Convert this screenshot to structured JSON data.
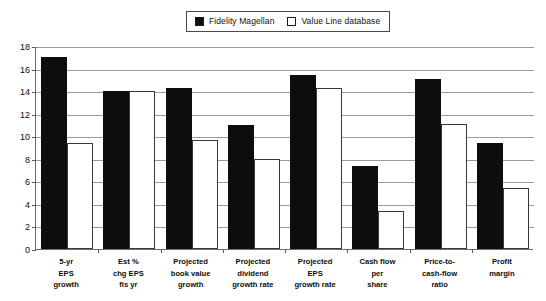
{
  "chart_data": {
    "type": "bar",
    "title": "",
    "subtitle": "",
    "xlabel": "",
    "ylabel": "",
    "ylim": [
      0,
      18
    ],
    "ytick_step": 2,
    "yticks": [
      18,
      16,
      14,
      12,
      10,
      8,
      6,
      4,
      2,
      0
    ],
    "grid": true,
    "legend_position": "top-center",
    "categories": [
      "5-yr EPS growth",
      "Est % chg EPS fis yr",
      "Projected book value growth",
      "Projected dividend growth rate",
      "Projected EPS growth rate",
      "Cash flow per share",
      "Price-to-cash-flow ratio",
      "Profit margin"
    ],
    "category_lines": [
      [
        "5-yr",
        "EPS",
        "growth"
      ],
      [
        "Est %",
        "chg EPS",
        "fis yr"
      ],
      [
        "Projected",
        "book value",
        "growth"
      ],
      [
        "Projected",
        "dividend",
        "growth rate"
      ],
      [
        "Projected",
        "EPS",
        "growth rate"
      ],
      [
        "Cash flow",
        "per",
        "share"
      ],
      [
        "Price-to-",
        "cash-flow",
        "ratio"
      ],
      [
        "Profit",
        "margin"
      ]
    ],
    "series": [
      {
        "name": "Fidelity Magellan",
        "color": "#0d0d0d",
        "style": "filled",
        "values": [
          17.0,
          14.0,
          14.3,
          11.0,
          15.4,
          7.4,
          15.1,
          9.4
        ]
      },
      {
        "name": "Value Line database",
        "color": "#ffffff",
        "style": "hollow",
        "values": [
          9.4,
          14.0,
          9.7,
          8.0,
          14.3,
          3.4,
          11.1,
          5.4
        ]
      }
    ]
  },
  "legend": {
    "entries": [
      {
        "label": "Fidelity Magellan",
        "swatch": "filled-square-icon"
      },
      {
        "label": "Value Line database",
        "swatch": "hollow-square-icon"
      }
    ]
  }
}
